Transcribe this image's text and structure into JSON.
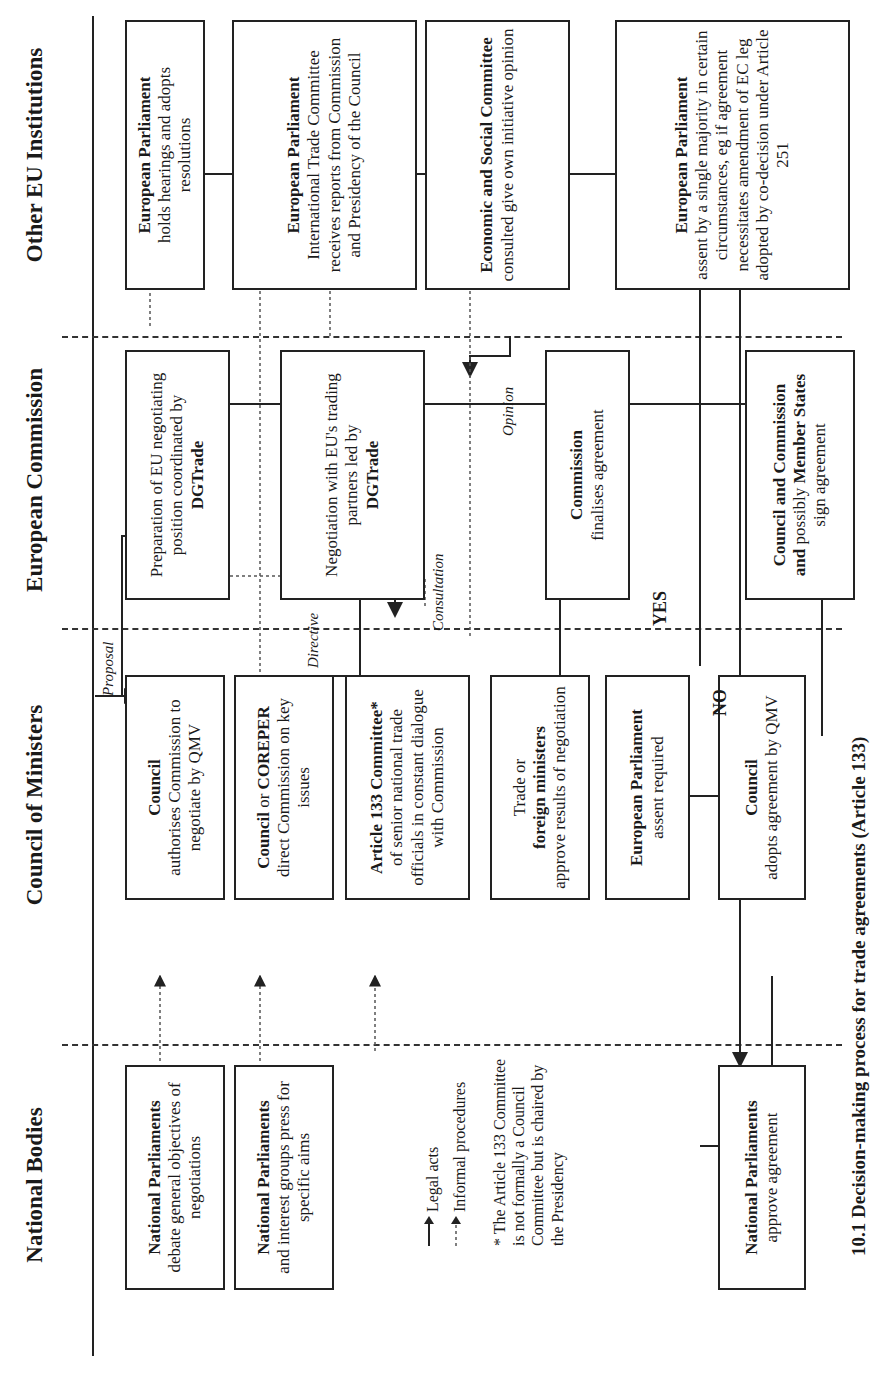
{
  "columns": {
    "national": "National Bodies",
    "council": "Council of Ministers",
    "commission": "European Commission",
    "other": "Other EU Institutions"
  },
  "boxes": {
    "np_debate": {
      "bold": "National Parliaments",
      "text": "debate general objectives of negotiations"
    },
    "np_interest": {
      "bold": "National Parliaments",
      "text": "and interest groups press for specific aims"
    },
    "np_approve": {
      "bold": "National Parliaments",
      "text": "approve agreement"
    },
    "council_auth": {
      "bold": "Council",
      "text": "authorises Commission to negotiate by QMV"
    },
    "coreper": {
      "bold1": "Council",
      "mid": "or",
      "bold2": "COREPER",
      "text": "direct Commission on key issues"
    },
    "art133": {
      "bold": "Article 133 Committee*",
      "text": "of senior national trade officials in constant dialogue with Commission"
    },
    "trade_min": {
      "pre": "Trade or",
      "bold": "foreign ministers",
      "text": "approve results of negotiation"
    },
    "ep_assent": {
      "bold": "European Parliament",
      "text": "assent required"
    },
    "council_adopt": {
      "bold": "Council",
      "text": "adopts agreement by QMV"
    },
    "prep": {
      "text": "Preparation of EU negotiating position coordinated by",
      "bold": "DGTrade"
    },
    "negot": {
      "text": "Negotiation with EU's trading partners led by",
      "bold": "DGTrade"
    },
    "finalise": {
      "bold": "Commission",
      "text": "finalises agreement"
    },
    "sign": {
      "bold1": "Council and Commission",
      "mid": "and",
      "pre2": "possibly",
      "bold2": "Member States",
      "text": "sign agreement"
    },
    "ep_hear": {
      "bold": "European Parliament",
      "text": "holds hearings and adopts resolutions"
    },
    "ep_itc": {
      "bold": "European Parliament",
      "text": "International Trade Committee receives reports from Commission and Presidency of the Council"
    },
    "esc": {
      "bold": "Economic and Social Committee",
      "text": "consulted give own initiative opinion"
    },
    "ep_assent2": {
      "bold": "European Parliament",
      "text": "assent by a single majority in certain circumstances, eg if agreement necessitates amendment of EC leg adopted by co-decision under Article 251"
    }
  },
  "labels": {
    "proposal": "Proposal",
    "directive": "Directive",
    "consultation": "Consultation",
    "opinion": "Opinion",
    "yes": "YES",
    "no": "NO"
  },
  "legend": {
    "legal": "Legal acts",
    "informal": "Informal procedures"
  },
  "footnote": "* The Article 133 Committee is not formally a Council Committee but is chaired by the Presidency",
  "caption": "10.1 Decision-making process for trade agreements (Article 133)"
}
